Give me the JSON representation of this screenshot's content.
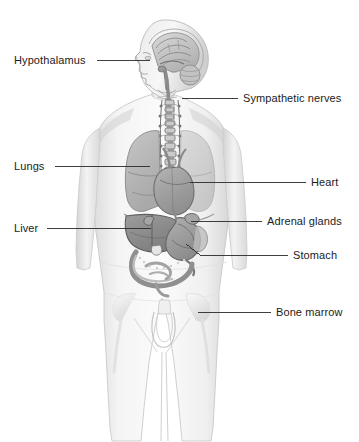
{
  "figure": {
    "background_color": "#ffffff",
    "ink_color": "#1b1b1b",
    "body_fill": "#f2f2f2",
    "organ_fill": "#b9b9b9",
    "leader_line_color": "#2a2a2a"
  },
  "labels": [
    {
      "id": "hypothalamus",
      "text": "Hypothalamus",
      "side": "left",
      "text_x": 14,
      "text_y": 54,
      "line_x1": 97,
      "line_x2": 150,
      "line_y": 60,
      "target": "brain-hypothalamus"
    },
    {
      "id": "lungs",
      "text": "Lungs",
      "side": "left",
      "text_x": 14,
      "text_y": 160,
      "line_x1": 55,
      "line_x2": 150,
      "line_y": 166,
      "target": "left-lung"
    },
    {
      "id": "liver",
      "text": "Liver",
      "side": "left",
      "text_x": 14,
      "text_y": 222,
      "line_x1": 47,
      "line_x2": 151,
      "line_y": 228,
      "target": "liver-organ"
    },
    {
      "id": "sympathetic-nerves",
      "text": "Sympathetic nerves",
      "side": "right",
      "text_x": 243,
      "text_y": 92,
      "line_x1": 182,
      "line_x2": 238,
      "line_y": 98,
      "target": "sympathetic-chain"
    },
    {
      "id": "heart",
      "text": "Heart",
      "side": "right",
      "text_x": 311,
      "text_y": 176,
      "line_x1": 190,
      "line_x2": 306,
      "line_y": 182,
      "target": "heart-organ"
    },
    {
      "id": "adrenal-glands",
      "text": "Adrenal glands",
      "side": "right",
      "text_x": 267,
      "text_y": 215,
      "line_x1": 191,
      "line_x2": 262,
      "line_y": 221,
      "target": "adrenal-gland"
    },
    {
      "id": "stomach",
      "text": "Stomach",
      "side": "right",
      "text_x": 293,
      "text_y": 249,
      "line_x1": 200,
      "line_x2": 288,
      "line_y": 255,
      "target": "stomach-organ"
    },
    {
      "id": "bone-marrow",
      "text": "Bone marrow",
      "side": "right",
      "text_x": 276,
      "text_y": 306,
      "line_x1": 198,
      "line_x2": 271,
      "line_y": 312,
      "target": "pelvis-femur-marrow"
    }
  ],
  "organs": [
    {
      "id": "brain",
      "name": "brain"
    },
    {
      "id": "cerebellum",
      "name": "cerebellum"
    },
    {
      "id": "brainstem",
      "name": "brainstem"
    },
    {
      "id": "left-lung",
      "name": "left lung"
    },
    {
      "id": "right-lung",
      "name": "right lung"
    },
    {
      "id": "heart-organ",
      "name": "heart"
    },
    {
      "id": "sympathetic-chain",
      "name": "sympathetic nerve chain"
    },
    {
      "id": "liver-organ",
      "name": "liver"
    },
    {
      "id": "stomach-organ",
      "name": "stomach"
    },
    {
      "id": "adrenal-gland",
      "name": "adrenal gland"
    },
    {
      "id": "intestines",
      "name": "intestines"
    },
    {
      "id": "pelvis-femur-marrow",
      "name": "pelvis and femur bone marrow"
    }
  ]
}
